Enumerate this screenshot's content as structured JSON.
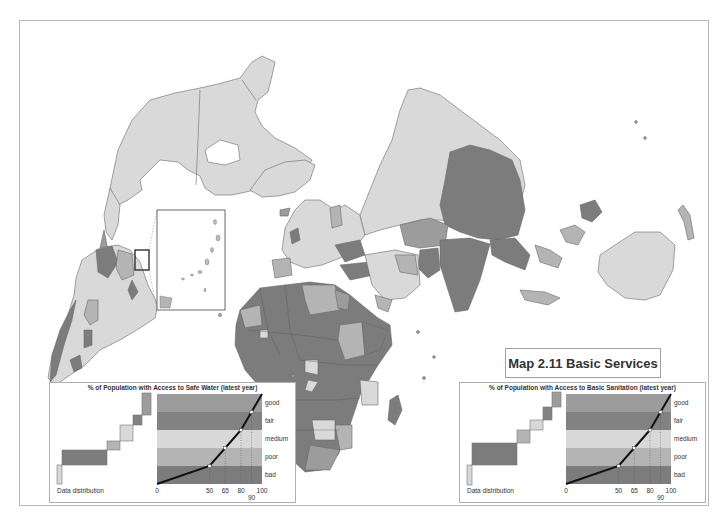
{
  "title": "Map 2.11 Basic Services",
  "colors": {
    "good": "#9c9c9c",
    "fair": "#828282",
    "medium": "#d8d8d8",
    "poor": "#b4b4b4",
    "bad": "#7c7c7c",
    "land_light": "#d9d9d9",
    "border": "#6a6a6a",
    "frame": "#b8b8b8"
  },
  "legends": [
    {
      "id": "water",
      "title": "% of Population with Access to Safe Water (latest year)",
      "distribution_label": "Data distribution",
      "classes": [
        "good",
        "fair",
        "medium",
        "poor",
        "bad"
      ],
      "ticks": [
        "0",
        "50",
        "65",
        "80",
        "90",
        "100"
      ],
      "breaks": [
        0,
        50,
        65,
        80,
        90,
        100
      ]
    },
    {
      "id": "sanitation",
      "title": "% of Population with Access to Basic Sanitation (latest year)",
      "distribution_label": "Data distribution",
      "classes": [
        "good",
        "fair",
        "medium",
        "poor",
        "bad"
      ],
      "ticks": [
        "0",
        "50",
        "65",
        "80",
        "90",
        "100"
      ],
      "breaks": [
        0,
        50,
        65,
        80,
        90,
        100
      ]
    }
  ],
  "inset": {
    "label": "Caribbean inset"
  }
}
